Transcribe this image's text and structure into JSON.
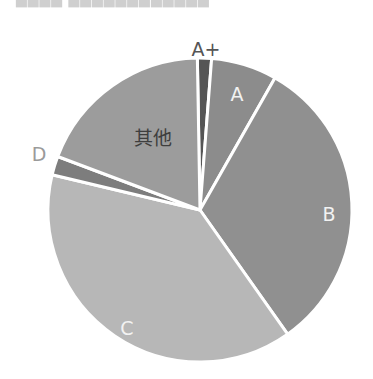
{
  "header": {
    "title_cut_off": "▄▄▄▄  ▄▄▄▄▄▄▄▄▄▄▄▄"
  },
  "chart_data": {
    "type": "pie",
    "title": "",
    "center": [
      200,
      210
    ],
    "radius": 152,
    "start_angle_deg": -1,
    "direction": "clockwise",
    "slice_gap_color": "#ffffff",
    "slices": [
      {
        "label": "A+",
        "value": 1.5,
        "color": "#555555",
        "label_color": "#555555",
        "label_pos": [
          206,
          50
        ],
        "label_outside": true
      },
      {
        "label": "A",
        "value": 7.0,
        "color": "#8c8c8c",
        "label_color": "#f2f2f2",
        "label_pos": [
          237,
          95
        ],
        "label_outside": false
      },
      {
        "label": "B",
        "value": 32.0,
        "color": "#909090",
        "label_color": "#f2f2f2",
        "label_pos": [
          329,
          215
        ],
        "label_outside": false
      },
      {
        "label": "C",
        "value": 38.5,
        "color": "#b7b7b7",
        "label_color": "#f2f2f2",
        "label_pos": [
          127,
          329
        ],
        "label_outside": false
      },
      {
        "label": "D",
        "value": 2.0,
        "color": "#7d7d7d",
        "label_color": "#9a9a9a",
        "label_pos": [
          39,
          155
        ],
        "label_outside": true
      },
      {
        "label": "其他",
        "value": 19.0,
        "color": "#9c9c9c",
        "label_color": "#3e3e3e",
        "label_pos": [
          153,
          139
        ],
        "label_outside": false
      }
    ],
    "legend": null,
    "grid": false
  }
}
